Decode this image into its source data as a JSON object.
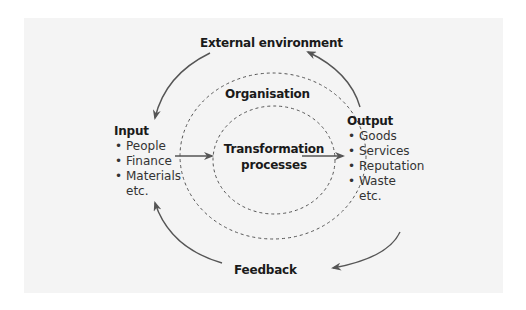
{
  "diagram": {
    "external": "External environment",
    "organisation": "Organisation",
    "transformation": [
      "Transformation",
      "processes"
    ],
    "feedback": "Feedback",
    "input": {
      "title": "Input",
      "items": [
        "People",
        "Finance",
        "Materials"
      ],
      "etc": "etc."
    },
    "output": {
      "title": "Output",
      "items": [
        "Goods",
        "Services",
        "Reputation",
        "Waste"
      ],
      "etc": "etc."
    }
  },
  "colors": {
    "panel": "#f4f4f4",
    "line": "#555555",
    "text": "#1a1a1a"
  }
}
